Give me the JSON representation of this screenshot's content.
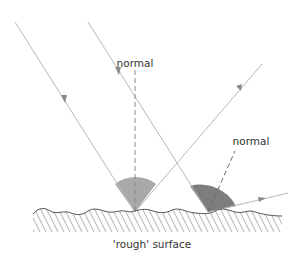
{
  "diagram": {
    "labels": {
      "normal_left": "normal",
      "normal_right": "normal",
      "surface": "'rough' surface"
    },
    "colors": {
      "ray": "#b8b8b8",
      "arrow": "#8a8a8a",
      "normal_line": "#8a8a8a",
      "angle_fill_left": "#a9a9a9",
      "angle_fill_right": "#7d7d7d",
      "surface_line": "#555555",
      "hatch": "#9a9a9a",
      "text": "#333333"
    }
  }
}
